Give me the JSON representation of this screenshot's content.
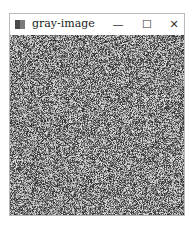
{
  "window": {
    "title": "gray-image",
    "controls": {
      "minimize": "—",
      "maximize": "☐",
      "close": "✕"
    }
  },
  "content": {
    "description": "random gray noise image"
  }
}
